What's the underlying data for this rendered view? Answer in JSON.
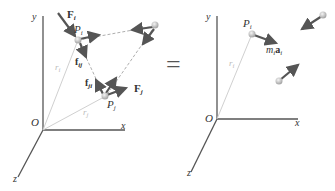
{
  "left_panel": {
    "axes": {
      "y_label": "y",
      "x_label": "x",
      "z_label": "z",
      "origin_label": "O"
    },
    "labels": {
      "Fi": "F",
      "Fi_sub": "i",
      "Pi": "P",
      "Pi_sub": "i",
      "ri": "r",
      "ri_sub": "i",
      "fij": "f",
      "fij_sub": "ij",
      "fji": "f",
      "fji_sub": "ji",
      "Fj": "F",
      "Fj_sub": "j",
      "Pj": "P",
      "Pj_sub": "j",
      "rj": "r",
      "rj_sub": "j"
    }
  },
  "equals_sign": "=",
  "right_panel": {
    "axes": {
      "y_label": "y",
      "x_label": "x",
      "z_label": "z",
      "origin_label": "O"
    },
    "labels": {
      "Pi": "P",
      "Pi_sub": "i",
      "ri": "r",
      "ri_sub": "i",
      "miai_m": "m",
      "miai_m_sub": "i",
      "miai_a": "a",
      "miai_a_sub": "i"
    }
  },
  "colors": {
    "axis": "#555555",
    "arrow": "#555555",
    "position_vector": "#cccccc",
    "particle": "#c8c8c8",
    "dashed": "#999999"
  }
}
